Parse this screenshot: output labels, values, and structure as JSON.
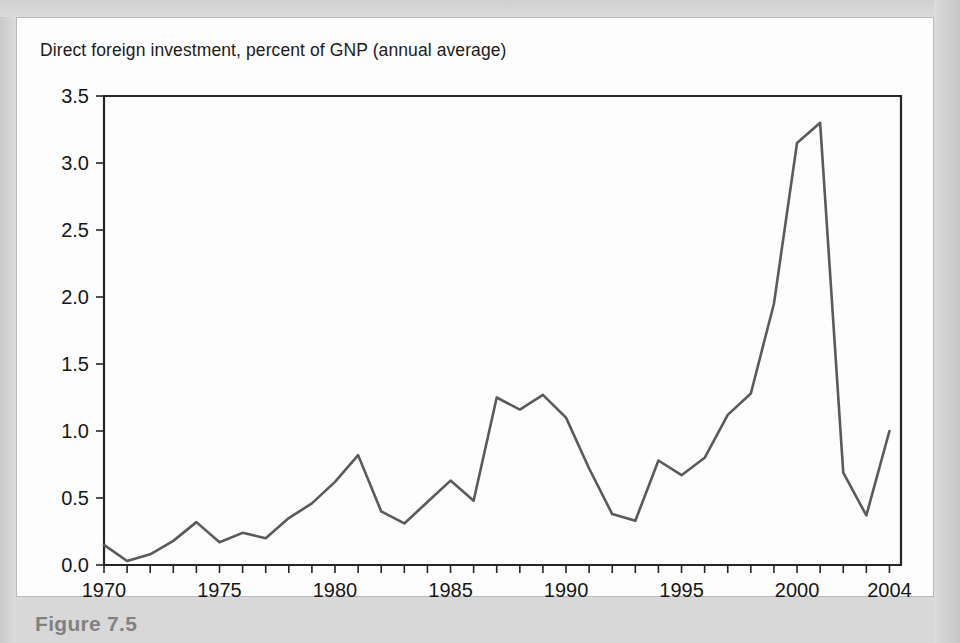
{
  "figure": {
    "title": "Direct foreign investment, percent of GNP (annual average)",
    "caption_fragment": "Figure 7.5",
    "card_background": "#fdfdfd",
    "page_background": "#d8d8d8",
    "line_color": "#5a5a5a",
    "axis_color": "#262626"
  },
  "chart_data": {
    "type": "line",
    "title": "Direct foreign investment, percent of GNP (annual average)",
    "xlabel": "",
    "ylabel": "",
    "xlim": [
      1970,
      2004.5
    ],
    "ylim": [
      0.0,
      3.5
    ],
    "grid": false,
    "legend": "none",
    "yticks": [
      0.0,
      0.5,
      1.0,
      1.5,
      2.0,
      2.5,
      3.0,
      3.5
    ],
    "ytick_labels": [
      "0.0",
      "0.5",
      "1.0",
      "1.5",
      "2.0",
      "2.5",
      "3.0",
      "3.5"
    ],
    "xticks": [
      1970,
      1971,
      1972,
      1973,
      1974,
      1975,
      1976,
      1977,
      1978,
      1979,
      1980,
      1981,
      1982,
      1983,
      1984,
      1985,
      1986,
      1987,
      1988,
      1989,
      1990,
      1991,
      1992,
      1993,
      1994,
      1995,
      1996,
      1997,
      1998,
      1999,
      2000,
      2001,
      2002,
      2003,
      2004
    ],
    "xtick_labels": [
      "1970",
      "1975",
      "1980",
      "1985",
      "1990",
      "1995",
      "2000",
      "2004"
    ],
    "xtick_label_years": [
      1970,
      1975,
      1980,
      1985,
      1990,
      1995,
      2000,
      2004
    ],
    "series": [
      {
        "name": "Direct foreign investment (% of GNP)",
        "x": [
          1970,
          1971,
          1972,
          1973,
          1974,
          1975,
          1976,
          1977,
          1978,
          1979,
          1980,
          1981,
          1982,
          1983,
          1984,
          1985,
          1986,
          1987,
          1988,
          1989,
          1990,
          1991,
          1992,
          1993,
          1994,
          1995,
          1996,
          1997,
          1998,
          1999,
          2000,
          2001,
          2002,
          2003,
          2004
        ],
        "values": [
          0.15,
          0.03,
          0.08,
          0.18,
          0.32,
          0.17,
          0.24,
          0.2,
          0.35,
          0.46,
          0.62,
          0.82,
          0.4,
          0.31,
          0.47,
          0.63,
          0.48,
          1.25,
          1.16,
          1.27,
          1.1,
          0.72,
          0.38,
          0.33,
          0.78,
          0.67,
          0.8,
          1.12,
          1.28,
          1.95,
          3.15,
          3.3,
          0.69,
          0.37,
          1.0
        ]
      }
    ]
  }
}
